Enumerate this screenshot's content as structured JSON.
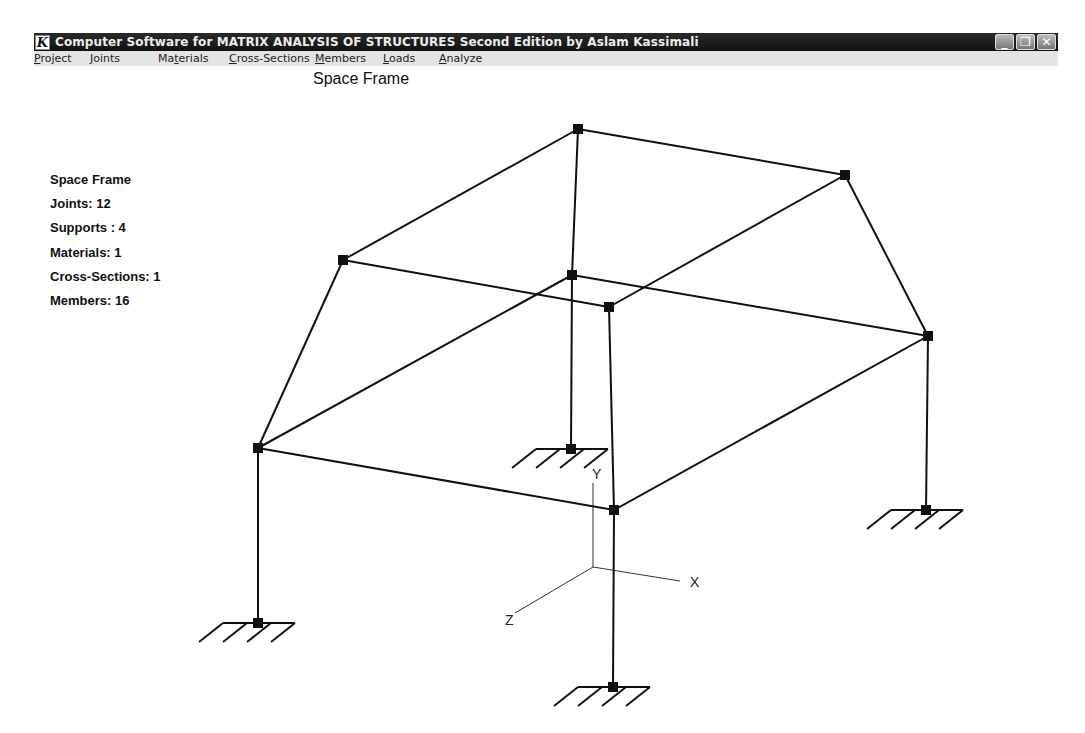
{
  "window": {
    "title": "Computer Software for MATRIX ANALYSIS OF STRUCTURES Second Edition by Aslam Kassimali",
    "app_icon_glyph": "K",
    "controls": {
      "minimize": "_",
      "restore": "❐",
      "close": "✕"
    }
  },
  "menu": {
    "items": [
      {
        "label": "Project",
        "mnemonic": "P"
      },
      {
        "label": "Joints",
        "mnemonic": "J"
      },
      {
        "label": "Materials",
        "mnemonic": "t"
      },
      {
        "label": "Cross-Sections",
        "mnemonic": "C"
      },
      {
        "label": "Members",
        "mnemonic": "M"
      },
      {
        "label": "Loads",
        "mnemonic": "L"
      },
      {
        "label": "Analyze",
        "mnemonic": "A"
      }
    ]
  },
  "view": {
    "title": "Space Frame"
  },
  "summary": {
    "structure_type": "Space Frame",
    "joints": "Joints: 12",
    "supports": "Supports : 4",
    "materials": "Materials: 1",
    "cross_sections": "Cross-Sections: 1",
    "members": "Members: 16"
  },
  "model": {
    "line_color": "#111111",
    "joints": {
      "top_back": [
        578,
        129
      ],
      "top_right": [
        845,
        175
      ],
      "top_left": [
        343,
        260
      ],
      "mid_back": [
        572,
        275
      ],
      "mid_front": [
        609,
        307
      ],
      "right": [
        928,
        336
      ],
      "left": [
        258,
        448
      ],
      "front": [
        614,
        510
      ],
      "sup_left": [
        258,
        623
      ],
      "sup_back": [
        571,
        449
      ],
      "sup_right": [
        926,
        510
      ],
      "sup_front": [
        613,
        687
      ]
    },
    "members": [
      [
        "top_left",
        "top_back"
      ],
      [
        "top_back",
        "top_right"
      ],
      [
        "top_back",
        "mid_back"
      ],
      [
        "top_left",
        "mid_front"
      ],
      [
        "top_right",
        "mid_front"
      ],
      [
        "top_right",
        "right"
      ],
      [
        "top_left",
        "left"
      ],
      [
        "left",
        "mid_back"
      ],
      [
        "mid_back",
        "right"
      ],
      [
        "left",
        "front"
      ],
      [
        "front",
        "right"
      ],
      [
        "mid_front",
        "front"
      ],
      [
        "left",
        "sup_left"
      ],
      [
        "mid_back",
        "sup_back"
      ],
      [
        "right",
        "sup_right"
      ],
      [
        "front",
        "sup_front"
      ]
    ],
    "supports": [
      "sup_left",
      "sup_back",
      "sup_right",
      "sup_front"
    ]
  },
  "axes": {
    "origin": [
      593,
      567
    ],
    "x_end": [
      680,
      581
    ],
    "x_label": "X",
    "y_end": [
      593,
      483
    ],
    "y_label": "Y",
    "z_end": [
      515,
      613
    ],
    "z_label": "Z"
  }
}
